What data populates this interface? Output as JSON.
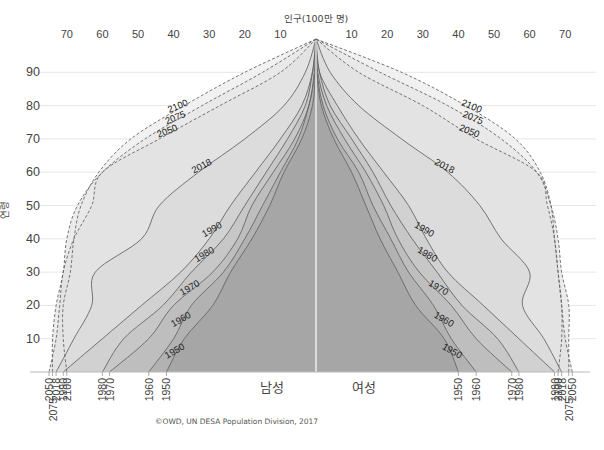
{
  "chart_data": {
    "type": "area",
    "title": "",
    "top_axis_title": "인구(100만 명)",
    "ylabel": "연령",
    "xlabel_left": "남성",
    "xlabel_right": "여성",
    "credit": "©OWD, UN DESA Population Division, 2017",
    "x_ticks_left": [
      70,
      60,
      50,
      40,
      30,
      20,
      10
    ],
    "x_ticks_right": [
      10,
      20,
      30,
      40,
      50,
      60,
      70
    ],
    "y_ticks": [
      90,
      80,
      70,
      60,
      50,
      40,
      30,
      20,
      10
    ],
    "xlim": [
      -70,
      70
    ],
    "ylim": [
      0,
      100
    ],
    "grid": "horizontal",
    "ages": [
      0,
      10,
      20,
      30,
      40,
      50,
      60,
      70,
      80,
      90,
      100
    ],
    "series": [
      {
        "name": "2100",
        "style": "dashed",
        "projection": true,
        "male": [
          70,
          71,
          71,
          69,
          68,
          66,
          61,
          52,
          37,
          20,
          0
        ],
        "female": [
          68,
          69,
          69,
          68,
          67,
          66,
          63,
          56,
          42,
          24,
          0
        ]
      },
      {
        "name": "2075",
        "style": "dashed",
        "projection": true,
        "male": [
          74,
          74,
          73,
          71,
          70,
          67,
          60,
          48,
          32,
          15,
          0
        ],
        "female": [
          71,
          71,
          71,
          69,
          68,
          66,
          62,
          52,
          37,
          18,
          0
        ]
      },
      {
        "name": "2050",
        "style": "dashed",
        "projection": true,
        "male": [
          75,
          73,
          72,
          71,
          68,
          63,
          60,
          44,
          27,
          10,
          0
        ],
        "female": [
          72,
          70,
          69,
          68,
          67,
          65,
          62,
          45,
          30,
          12,
          0
        ]
      },
      {
        "name": "2018",
        "style": "solid",
        "projection": false,
        "male": [
          73,
          68,
          63,
          62,
          49,
          44,
          33,
          20,
          9,
          3,
          0
        ],
        "female": [
          69,
          64,
          58,
          60,
          52,
          46,
          37,
          24,
          12,
          4,
          0
        ]
      },
      {
        "name": "1990",
        "style": "solid",
        "projection": false,
        "male": [
          71,
          60,
          49,
          38,
          30,
          24,
          17,
          10,
          4,
          1,
          0
        ],
        "female": [
          67,
          57,
          47,
          37,
          31,
          26,
          19,
          12,
          6,
          1,
          0
        ]
      },
      {
        "name": "1980",
        "style": "solid",
        "projection": false,
        "male": [
          60,
          54,
          43,
          35,
          26,
          20,
          14,
          8,
          3,
          1,
          0
        ],
        "female": [
          57,
          51,
          41,
          34,
          27,
          21,
          16,
          10,
          4,
          1,
          0
        ]
      },
      {
        "name": "1970",
        "style": "solid",
        "projection": false,
        "male": [
          58,
          47,
          40,
          29,
          22,
          18,
          12,
          6,
          2,
          0.5,
          0
        ],
        "female": [
          55,
          45,
          38,
          29,
          23,
          19,
          14,
          8,
          3,
          0.5,
          0
        ]
      },
      {
        "name": "1960",
        "style": "solid",
        "projection": false,
        "male": [
          47,
          40,
          35,
          26,
          20,
          15,
          10,
          5,
          2,
          0.3,
          0
        ],
        "female": [
          45,
          38,
          33,
          26,
          21,
          16,
          12,
          6,
          2,
          0.3,
          0
        ]
      },
      {
        "name": "1950",
        "style": "solid",
        "projection": false,
        "male": [
          42,
          37,
          29,
          24,
          18,
          13,
          9,
          4,
          1,
          0.2,
          0
        ],
        "female": [
          40,
          36,
          28,
          23,
          18,
          14,
          10,
          5,
          1.5,
          0.2,
          0
        ]
      }
    ],
    "baseline_labels_left": [
      "2050",
      "2075",
      "2018",
      "1990",
      "2100",
      "1980",
      "1970",
      "1960",
      "1950"
    ],
    "baseline_labels_right": [
      "1950",
      "1960",
      "1970",
      "1980",
      "2100",
      "1990",
      "2075",
      "2018",
      "2050"
    ]
  },
  "colors": {
    "line": "#666666",
    "grid": "#e6e6e6",
    "center": "#ffffff",
    "fills": {
      "2100": "#efefef",
      "2075": "#e8e8e8",
      "2050": "#e2e2e2",
      "2018": "#dadada",
      "1990": "#cfcfcf",
      "1980": "#c5c5c5",
      "1970": "#bcbcbc",
      "1960": "#b0b0b0",
      "1950": "#a3a3a3"
    }
  }
}
